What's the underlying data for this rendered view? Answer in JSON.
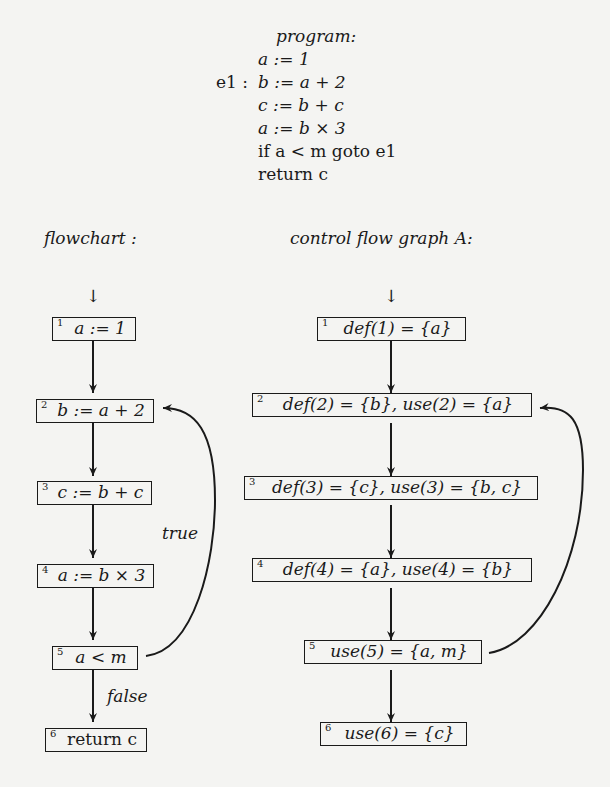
{
  "program": {
    "heading": "program:",
    "label": "e1 :",
    "lines": [
      "a := 1",
      "b := a + 2",
      "c := b + c",
      "a := b × 3",
      "if a < m goto e1",
      "return c"
    ]
  },
  "flowchart": {
    "heading": "flowchart :",
    "entry_arrow": "↓",
    "nodes": [
      {
        "id": "1",
        "text": "a := 1"
      },
      {
        "id": "2",
        "text": "b := a + 2"
      },
      {
        "id": "3",
        "text": "c := b + c"
      },
      {
        "id": "4",
        "text": "a := b × 3"
      },
      {
        "id": "5",
        "text": "a < m"
      },
      {
        "id": "6",
        "text": "return c"
      }
    ],
    "edge_labels": {
      "true": "true",
      "false": "false"
    }
  },
  "cfg": {
    "heading": "control flow graph  A:",
    "entry_arrow": "↓",
    "nodes": [
      {
        "id": "1",
        "text": "def(1) = {a}"
      },
      {
        "id": "2",
        "text": "def(2) = {b}, use(2) = {a}"
      },
      {
        "id": "3",
        "text": "def(3) = {c}, use(3) = {b, c}"
      },
      {
        "id": "4",
        "text": "def(4) = {a}, use(4) = {b}"
      },
      {
        "id": "5",
        "text": "use(5) = {a, m}"
      },
      {
        "id": "6",
        "text": "use(6) = {c}"
      }
    ]
  }
}
